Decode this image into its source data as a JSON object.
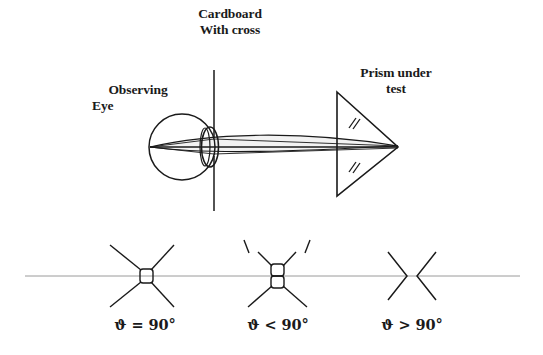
{
  "figure": {
    "background_color": "#ffffff",
    "ink_color": "#1a1a1a",
    "axis_color": "#9a9a9a"
  },
  "labels": {
    "cardboard_line1": "Cardboard",
    "cardboard_line2": "With cross",
    "eye_line1": "Observing",
    "eye_line2": "Eye",
    "prism_line1": "Prism under",
    "prism_line2": "test"
  },
  "cases": [
    {
      "id": "case-equal",
      "label": "ϑ = 90°",
      "symbol": "ϑ",
      "relation": "=",
      "angle": "90°",
      "description": "single cross, arms meet at one node"
    },
    {
      "id": "case-less",
      "label": "ϑ < 90°",
      "symbol": "ϑ",
      "relation": "<",
      "angle": "90°",
      "description": "cross split vertically into two nodes"
    },
    {
      "id": "case-greater",
      "label": "ϑ > 90°",
      "symbol": "ϑ",
      "relation": ">",
      "angle": "90°",
      "description": "cross separated into facing chevrons"
    }
  ],
  "geometry": {
    "cardboard_x": 214,
    "cardboard_top": 70,
    "cardboard_bottom": 211,
    "eye_center_x": 182,
    "eye_center_y": 147,
    "eye_radius": 33,
    "retina_x": 150,
    "prism_left_x": 337,
    "prism_apex_x": 398,
    "prism_top_y": 92,
    "prism_bottom_y": 196,
    "baseline_y": 276,
    "baseline_start_x": 25,
    "baseline_end_x": 520
  }
}
